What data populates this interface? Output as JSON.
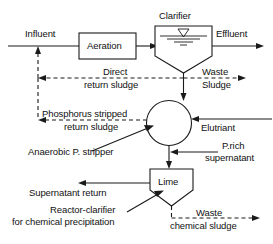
{
  "diagram": {
    "type": "process-flow-diagram",
    "colors": {
      "line": "#1a1a1a",
      "shape_fill": "#ffffff",
      "background": "#ffffff"
    },
    "units": [
      {
        "id": "aeration",
        "label": "Aeration",
        "shape": "rectangle"
      },
      {
        "id": "clarifier",
        "label": "Clarifier",
        "shape": "tank-with-v-bottom"
      },
      {
        "id": "stripper",
        "label": "",
        "shape": "circle"
      },
      {
        "id": "lime",
        "label": "Lime",
        "shape": "reactor-clarifier-pentagon"
      }
    ],
    "streams": [
      {
        "id": "influent",
        "label": "Influent",
        "style": "solid"
      },
      {
        "id": "effluent",
        "label": "Effluent",
        "style": "solid"
      },
      {
        "id": "direct-return-sludge",
        "label_line1": "Direct",
        "label_line2": "return sludge",
        "style": "dashed"
      },
      {
        "id": "waste-sludge",
        "label_line1": "Waste",
        "label_line2": "Sludge",
        "style": "dashed"
      },
      {
        "id": "phosphorus-stripped-return-sludge",
        "label_line1": "Phosphorus stripped",
        "label_line2": "return sludge",
        "style": "dashed"
      },
      {
        "id": "elutriant",
        "label": "Elutriant",
        "style": "solid"
      },
      {
        "id": "p-rich-supernatant",
        "label_line1": "P.rich",
        "label_line2": "supernatant",
        "style": "solid"
      },
      {
        "id": "supernatant-return",
        "label": "Supernatant return",
        "style": "solid"
      },
      {
        "id": "waste-chemical-sludge",
        "label_line1": "Waste",
        "label_line2": "chemical sludge",
        "style": "dashed"
      }
    ],
    "annotations": [
      {
        "id": "anaerobic-p-stripper",
        "label": "Anaerobic P. stripper",
        "leader": "points-to-circle"
      },
      {
        "id": "reactor-clarifier",
        "label_line1": "Reactor-clarifier",
        "label_line2": "for chemical precipitation",
        "leader": "points-to-lime"
      }
    ],
    "labels": {
      "influent": "Influent",
      "aeration": "Aeration",
      "clarifier": "Clarifier",
      "effluent": "Effluent",
      "direct": "Direct",
      "return_sludge": "return sludge",
      "waste": "Waste",
      "sludge": "Sludge",
      "phosphorus_stripped": "Phosphorus stripped",
      "return_sludge_2": "return sludge",
      "elutriant": "Elutriant",
      "anaerobic_p_stripper": "Anaerobic P. stripper",
      "p_rich": "P.rich",
      "supernatant": "supernatant",
      "lime": "Lime",
      "supernatant_return": "Supernatant return",
      "reactor_clarifier": "Reactor-clarifier",
      "for_chemical_precipitation": "for chemical precipitation",
      "waste_2": "Waste",
      "chemical_sludge": "chemical sludge"
    }
  }
}
